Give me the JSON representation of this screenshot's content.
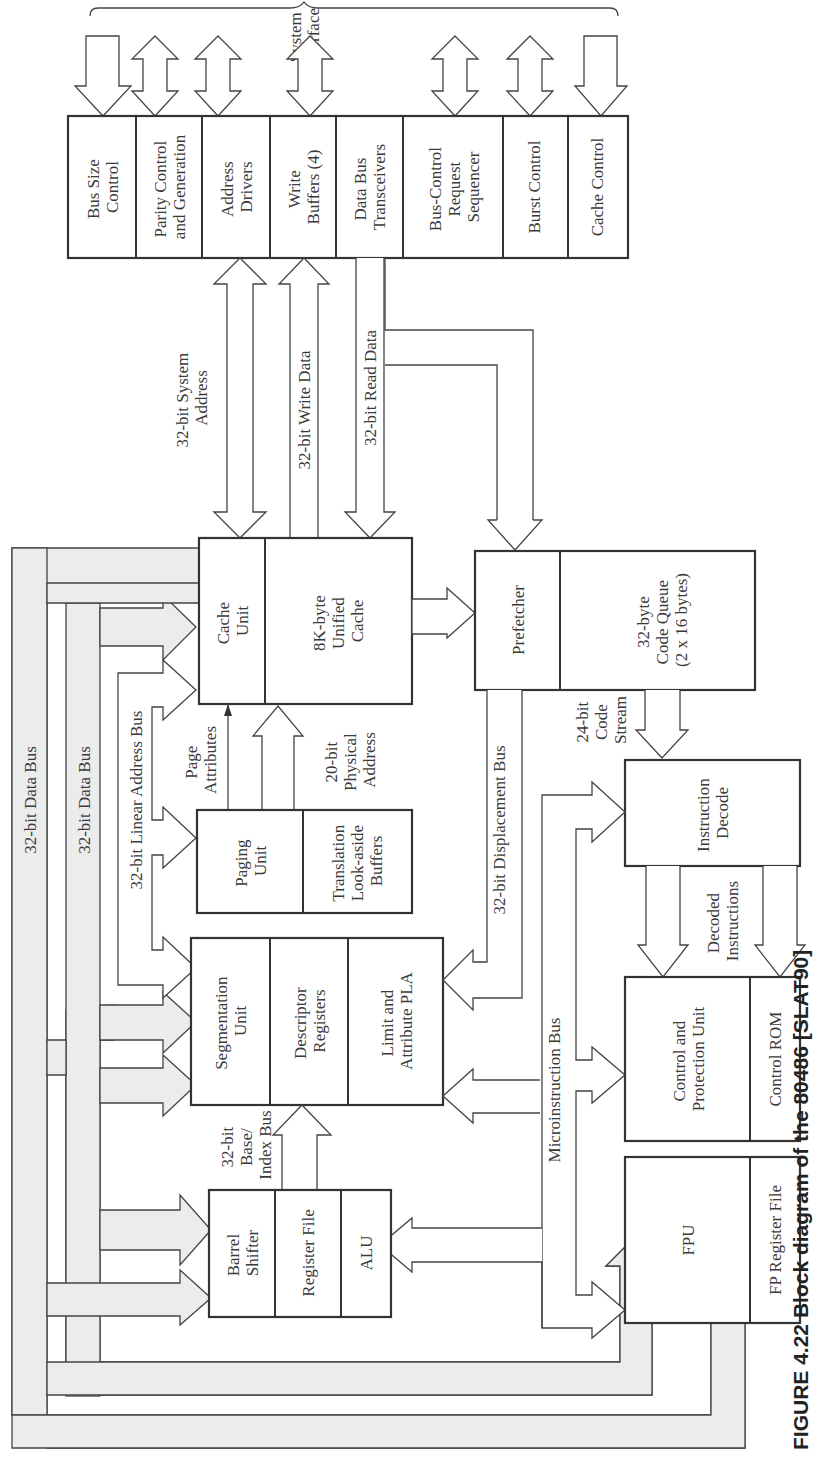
{
  "caption": "FIGURE 4.22   Block diagram of the 80486 [SLAT90]",
  "system_interface": {
    "label_line1": "System",
    "label_line2": "Interface"
  },
  "interface_blocks": [
    {
      "line1": "Bus Size",
      "line2": "Control",
      "line3": ""
    },
    {
      "line1": "Parity Control",
      "line2": "and Generation",
      "line3": ""
    },
    {
      "line1": "Address",
      "line2": "Drivers",
      "line3": ""
    },
    {
      "line1": "Write",
      "line2": "Buffers (4)",
      "line3": ""
    },
    {
      "line1": "Data Bus",
      "line2": "Transceivers",
      "line3": ""
    },
    {
      "line1": "Bus-Control",
      "line2": "Request",
      "line3": "Sequencer"
    },
    {
      "line1": "Burst Control",
      "line2": "",
      "line3": ""
    },
    {
      "line1": "Cache Control",
      "line2": "",
      "line3": ""
    }
  ],
  "blocks": {
    "cache_unit": {
      "line1": "Cache",
      "line2": "Unit"
    },
    "unified_cache": {
      "line1": "8K-byte",
      "line2": "Unified",
      "line3": "Cache"
    },
    "prefetcher": {
      "line1": "Prefetcher"
    },
    "code_queue": {
      "line1": "32-byte",
      "line2": "Code Queue",
      "line3": "(2 x 16 bytes)"
    },
    "paging_unit": {
      "line1": "Paging",
      "line2": "Unit"
    },
    "tlb": {
      "line1": "Translation",
      "line2": "Look-aside",
      "line3": "Buffers"
    },
    "instruction_decode": {
      "line1": "Instruction",
      "line2": "Decode"
    },
    "segmentation_unit": {
      "line1": "Segmentation",
      "line2": "Unit"
    },
    "descriptor_registers": {
      "line1": "Descriptor",
      "line2": "Registers"
    },
    "limit_pla": {
      "line1": "Limit and",
      "line2": "Attribute PLA"
    },
    "control_protection": {
      "line1": "Control and",
      "line2": "Protection Unit"
    },
    "control_rom": {
      "line1": "Control ROM"
    },
    "barrel_shifter": {
      "line1": "Barrel",
      "line2": "Shifter"
    },
    "register_file": {
      "line1": "Register File"
    },
    "alu": {
      "line1": "ALU"
    },
    "fpu": {
      "line1": "FPU"
    },
    "fp_register_file": {
      "line1": "FP Register File"
    }
  },
  "bus_labels": {
    "system_address": {
      "line1": "32-bit System",
      "line2": "Address"
    },
    "write_data": "32-bit Write Data",
    "read_data": "32-bit Read Data",
    "data_bus_1": "32-bit Data Bus",
    "data_bus_2": "32-bit Data Bus",
    "linear_address": "32-bit Linear Address Bus",
    "page_attributes": {
      "line1": "Page",
      "line2": "Attributes"
    },
    "physical_address": {
      "line1": "20-bit",
      "line2": "Physical",
      "line3": "Address"
    },
    "displacement": "32-bit Displacement Bus",
    "code_stream": {
      "line1": "24-bit",
      "line2": "Code",
      "line3": "Stream"
    },
    "decoded_instructions": {
      "line1": "Decoded",
      "line2": "Instructions"
    },
    "microinstruction": "Microinstruction Bus",
    "base_index": {
      "line1": "32-bit",
      "line2": "Base/",
      "line3": "Index Bus"
    }
  }
}
